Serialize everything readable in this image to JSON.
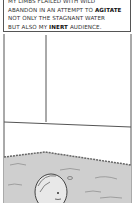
{
  "comic": {
    "caption": {
      "line1": "My limbs flailed with wild",
      "line2_pre": "abandon in an attempt to ",
      "line2_bold": "agitate",
      "line3": "not only the stagnant water",
      "line4_pre": "but also my ",
      "line4_bold": "inert",
      "line4_post": " audience."
    },
    "colors": {
      "ink": "#333333",
      "water": "#c8c8c8",
      "paper": "#ffffff"
    }
  }
}
